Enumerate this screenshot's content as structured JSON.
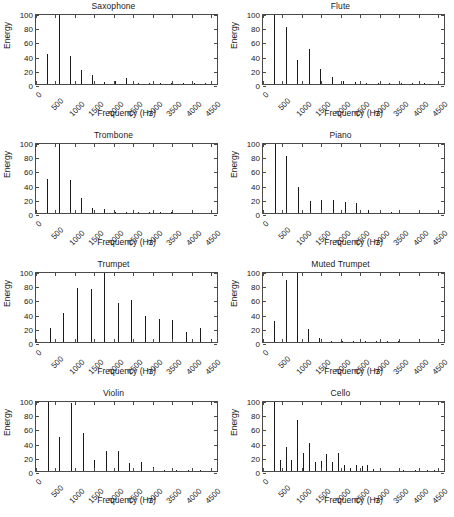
{
  "figure": {
    "layout": "2 columns x 4 rows of subplots",
    "axis_title_x": "Frequency (Hz)",
    "axis_title_y": "Energy",
    "xticks": [
      "0",
      "500",
      "1000",
      "1500",
      "2000",
      "2500",
      "3000",
      "3500",
      "4000",
      "4500"
    ],
    "yticks": [
      "0",
      "20",
      "40",
      "60",
      "80",
      "100"
    ]
  },
  "chart_data": [
    {
      "type": "bar",
      "title": "Saxophone",
      "xlabel": "Frequency (Hz)",
      "ylabel": "Energy",
      "xlim": [
        0,
        4700
      ],
      "ylim": [
        0,
        100
      ],
      "xticks": [
        0,
        500,
        1000,
        1500,
        2000,
        2500,
        3000,
        3500,
        4000,
        4500
      ],
      "yticks": [
        0,
        20,
        40,
        60,
        80,
        100
      ],
      "grid": false,
      "legend": "none",
      "x": [
        290,
        580,
        870,
        1160,
        1450,
        1740,
        2030,
        2320,
        2610,
        2900,
        3190,
        3480,
        3770,
        4060,
        4350
      ],
      "values": [
        42,
        100,
        39,
        20,
        13,
        3,
        4,
        8,
        1.5,
        2,
        2,
        1,
        1.5,
        1,
        0.5
      ]
    },
    {
      "type": "bar",
      "title": "Flute",
      "xlabel": "Frequency (Hz)",
      "ylabel": "Energy",
      "xlim": [
        0,
        4700
      ],
      "ylim": [
        0,
        100
      ],
      "xticks": [
        0,
        500,
        1000,
        1500,
        2000,
        2500,
        3000,
        3500,
        4000,
        4500
      ],
      "yticks": [
        0,
        20,
        40,
        60,
        80,
        100
      ],
      "grid": false,
      "legend": "none",
      "x": [
        295,
        590,
        885,
        1180,
        1475,
        1770,
        2065,
        2360,
        2655,
        2950,
        3245,
        3540,
        3835,
        4130
      ],
      "values": [
        100,
        80,
        34,
        50,
        21,
        10,
        4,
        2.5,
        2,
        1.5,
        1,
        1,
        0.8,
        0.6
      ]
    },
    {
      "type": "bar",
      "title": "Trombone",
      "xlabel": "Frequency (Hz)",
      "ylabel": "Energy",
      "xlim": [
        0,
        4700
      ],
      "ylim": [
        0,
        100
      ],
      "xticks": [
        0,
        500,
        1000,
        1500,
        2000,
        2500,
        3000,
        3500,
        4000,
        4500
      ],
      "yticks": [
        0,
        20,
        40,
        60,
        80,
        100
      ],
      "grid": false,
      "legend": "none",
      "x": [
        290,
        580,
        870,
        1160,
        1450,
        1740,
        2030,
        2320,
        2610,
        2900,
        3190,
        3480
      ],
      "values": [
        48,
        100,
        46,
        21,
        7,
        5,
        2,
        1.5,
        1,
        1,
        0.8,
        0.6
      ]
    },
    {
      "type": "bar",
      "title": "Piano",
      "xlabel": "Frequency (Hz)",
      "ylabel": "Energy",
      "xlim": [
        0,
        4700
      ],
      "ylim": [
        0,
        100
      ],
      "xticks": [
        0,
        500,
        1000,
        1500,
        2000,
        2500,
        3000,
        3500,
        4000,
        4500
      ],
      "yticks": [
        0,
        20,
        40,
        60,
        80,
        100
      ],
      "grid": false,
      "legend": "none",
      "x": [
        300,
        600,
        900,
        1200,
        1500,
        1800,
        2100,
        2400,
        2700,
        3000,
        3300
      ],
      "values": [
        100,
        80,
        37,
        17,
        18,
        18,
        16,
        14,
        4,
        2,
        1
      ]
    },
    {
      "type": "bar",
      "title": "Trumpet",
      "xlabel": "Frequency (Hz)",
      "ylabel": "Energy",
      "xlim": [
        0,
        4700
      ],
      "ylim": [
        0,
        100
      ],
      "xticks": [
        0,
        500,
        1000,
        1500,
        2000,
        2500,
        3000,
        3500,
        4000,
        4500
      ],
      "yticks": [
        0,
        20,
        40,
        60,
        80,
        100
      ],
      "grid": false,
      "legend": "none",
      "x": [
        350,
        700,
        1050,
        1400,
        1750,
        2100,
        2450,
        2800,
        3150,
        3500,
        3850,
        4200
      ],
      "values": [
        20,
        41,
        76,
        75,
        100,
        55,
        59,
        37,
        32,
        31,
        14,
        20
      ]
    },
    {
      "type": "bar",
      "title": "Muted Trumpet",
      "xlabel": "Frequency (Hz)",
      "ylabel": "Energy",
      "xlim": [
        0,
        4700
      ],
      "ylim": [
        0,
        100
      ],
      "xticks": [
        0,
        500,
        1000,
        1500,
        2000,
        2500,
        3000,
        3500,
        4000,
        4500
      ],
      "yticks": [
        0,
        20,
        40,
        60,
        80,
        100
      ],
      "grid": false,
      "legend": "none",
      "x": [
        290,
        580,
        870,
        1160,
        1450,
        1740,
        2030,
        2320,
        2610,
        2900,
        3190,
        3480
      ],
      "values": [
        29,
        88,
        100,
        18,
        6,
        2,
        1.5,
        1,
        1,
        2,
        1,
        1.5
      ]
    },
    {
      "type": "bar",
      "title": "Violin",
      "xlabel": "Frequency (Hz)",
      "ylabel": "Energy",
      "xlim": [
        0,
        4700
      ],
      "ylim": [
        0,
        100
      ],
      "xticks": [
        0,
        500,
        1000,
        1500,
        2000,
        2500,
        3000,
        3500,
        4000,
        4500
      ],
      "yticks": [
        0,
        20,
        40,
        60,
        80,
        100
      ],
      "grid": false,
      "legend": "none",
      "x": [
        300,
        600,
        900,
        1200,
        1500,
        1800,
        2100,
        2400,
        2700,
        3000,
        3300,
        3600,
        3900,
        4200
      ],
      "values": [
        100,
        48,
        96,
        53,
        16,
        28,
        28,
        11,
        12,
        5,
        2,
        1,
        2,
        2
      ]
    },
    {
      "type": "bar",
      "title": "Cello",
      "xlabel": "Frequency (Hz)",
      "ylabel": "Energy",
      "xlim": [
        0,
        4700
      ],
      "ylim": [
        0,
        100
      ],
      "xticks": [
        0,
        500,
        1000,
        1500,
        2000,
        2500,
        3000,
        3500,
        4000,
        4500
      ],
      "yticks": [
        0,
        20,
        40,
        60,
        80,
        100
      ],
      "grid": false,
      "legend": "none",
      "x": [
        290,
        440,
        580,
        730,
        880,
        1030,
        1180,
        1330,
        1480,
        1630,
        1780,
        1930,
        2080,
        2230,
        2380,
        2530,
        2680,
        2830,
        3000,
        3600,
        3900,
        4200,
        4400
      ],
      "values": [
        100,
        15,
        34,
        16,
        72,
        25,
        39,
        13,
        14,
        24,
        12,
        25,
        9,
        4,
        9,
        7,
        9,
        3,
        2,
        2,
        1,
        1,
        1
      ]
    }
  ]
}
